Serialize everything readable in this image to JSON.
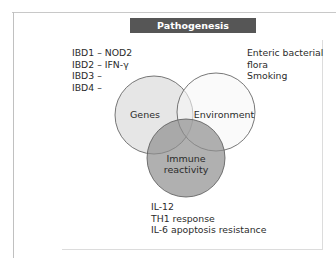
{
  "title": "Pathogenesis",
  "venn": {
    "circles": [
      {
        "id": "genes",
        "label": "Genes",
        "cx": 154,
        "cy": 115,
        "r": 39,
        "fill": "#dedede"
      },
      {
        "id": "environment",
        "label": "Environment",
        "cx": 216,
        "cy": 112,
        "r": 39,
        "fill": "#f7f7f7"
      },
      {
        "id": "immune",
        "label_line1": "Immune",
        "label_line2": "reactivity",
        "cx": 186,
        "cy": 158,
        "r": 39,
        "fill": "#8f8f8f"
      }
    ],
    "outline_color": "#555555"
  },
  "genes_notes": [
    "IBD1 – NOD2",
    "IBD2 – IFN-γ",
    "IBD3 –",
    "IBD4 –"
  ],
  "environment_notes": [
    "Enteric bacterial",
    "flora",
    "Smoking"
  ],
  "immune_notes": [
    "IL-12",
    "TH1 response",
    "IL-6 apoptosis resistance"
  ],
  "colors": {
    "title_bg": "#565656",
    "title_text": "#ffffff"
  }
}
